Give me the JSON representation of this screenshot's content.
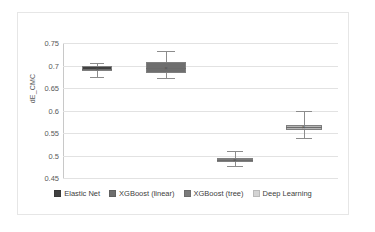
{
  "chart_data": {
    "type": "box",
    "title": "",
    "xlabel": "",
    "ylabel": "dE_CMC",
    "ylim": [
      0.45,
      0.75
    ],
    "ytick_labels": [
      "0.75",
      "0.7",
      "0.65",
      "0.6",
      "0.55",
      "0.5",
      "0.45"
    ],
    "ytick_values": [
      0.75,
      0.7,
      0.65,
      0.6,
      0.55,
      0.5,
      0.45
    ],
    "grid": true,
    "legend_position": "bottom",
    "categories": [
      "Elastic Net",
      "XGBoost (linear)",
      "XGBoost (tree)",
      "Deep Learning"
    ],
    "series": [
      {
        "name": "Elastic Net",
        "color": "#404040",
        "whisker_low": 0.675,
        "q1": 0.688,
        "median": 0.693,
        "q3": 0.698,
        "whisker_high": 0.705
      },
      {
        "name": "XGBoost (linear)",
        "color": "#6e6e6e",
        "whisker_low": 0.673,
        "q1": 0.683,
        "median": 0.695,
        "q3": 0.707,
        "whisker_high": 0.733
      },
      {
        "name": "XGBoost (tree)",
        "color": "#7b7b7b",
        "whisker_low": 0.477,
        "q1": 0.486,
        "median": 0.49,
        "q3": 0.494,
        "whisker_high": 0.51
      },
      {
        "name": "Deep Learning",
        "color": "#b5b5b5",
        "whisker_low": 0.538,
        "q1": 0.557,
        "median": 0.563,
        "q3": 0.568,
        "whisker_high": 0.6
      }
    ]
  },
  "axis": {
    "y_title": "dE_CMC"
  },
  "legend": {
    "items": [
      {
        "label": "Elastic Net",
        "color": "#404040"
      },
      {
        "label": "XGBoost (linear)",
        "color": "#6e6e6e"
      },
      {
        "label": "XGBoost (tree)",
        "color": "#7b7b7b"
      },
      {
        "label": "Deep Learning",
        "color": "#d4d4d4"
      }
    ]
  },
  "ticks": {
    "labels": [
      "0.75",
      "0.7",
      "0.65",
      "0.6",
      "0.55",
      "0.5",
      "0.45"
    ]
  }
}
